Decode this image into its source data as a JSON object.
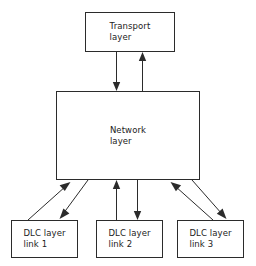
{
  "diagram": {
    "background_color": "#ffffff",
    "line_color": "#2b2b2b",
    "text_color": "#1c1c1c",
    "nodes": [
      {
        "id": "transport",
        "label": "Transport\nlayer",
        "line1": "Transport",
        "line2": "layer",
        "x": 85,
        "y": 12,
        "width": 90,
        "height": 40
      },
      {
        "id": "network",
        "label": "Network\nlayer",
        "line1": "Network",
        "line2": "layer",
        "x": 56,
        "y": 91,
        "width": 144,
        "height": 89
      },
      {
        "id": "dlc1",
        "label": "DLC layer\nlink 1",
        "line1": "DLC layer",
        "line2": "link 1",
        "x": 11,
        "y": 220,
        "width": 67,
        "height": 38
      },
      {
        "id": "dlc2",
        "label": "DLC layer\nlink 2",
        "line1": "DLC layer",
        "line2": "link 2",
        "x": 96,
        "y": 220,
        "width": 67,
        "height": 38
      },
      {
        "id": "dlc3",
        "label": "DLC layer\nlink 3",
        "line1": "DLC layer",
        "line2": "link 3",
        "x": 177,
        "y": 220,
        "width": 67,
        "height": 38
      }
    ],
    "edges": [
      {
        "id": "transport-to-network",
        "from": "transport",
        "to": "network",
        "direction": "down"
      },
      {
        "id": "network-to-transport",
        "from": "network",
        "to": "transport",
        "direction": "up"
      },
      {
        "id": "dlc1-to-network",
        "from": "dlc1",
        "to": "network",
        "direction": "up-left"
      },
      {
        "id": "network-to-dlc1",
        "from": "network",
        "to": "dlc1",
        "direction": "down-left"
      },
      {
        "id": "dlc2-to-network",
        "from": "dlc2",
        "to": "network",
        "direction": "up"
      },
      {
        "id": "network-to-dlc2",
        "from": "network",
        "to": "dlc2",
        "direction": "down"
      },
      {
        "id": "dlc3-to-network",
        "from": "dlc3",
        "to": "network",
        "direction": "up-right"
      },
      {
        "id": "network-to-dlc3",
        "from": "network",
        "to": "dlc3",
        "direction": "down-right"
      }
    ]
  }
}
